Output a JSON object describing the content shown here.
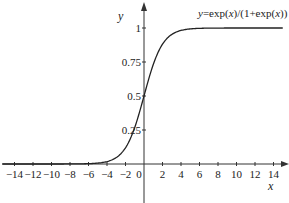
{
  "chart_data": {
    "type": "line",
    "title": "y=exp(x)/(1+exp(x))",
    "title_parts": {
      "pre": "y",
      "mid1": "=exp(",
      "x1": "x",
      "mid2": ")/(1+exp(",
      "x2": "x",
      "post": "))"
    },
    "xlabel": "x",
    "ylabel": "y",
    "xlim": [
      -15.5,
      15.3
    ],
    "ylim": [
      -0.25,
      1.2
    ],
    "grid": false,
    "legend": null,
    "x_ticks": [
      -14,
      -12,
      -10,
      -8,
      -6,
      -4,
      -2,
      0,
      2,
      4,
      6,
      8,
      10,
      12,
      14
    ],
    "x_tick_labels": [
      "−14",
      "−12",
      "−10",
      "−8",
      "−6",
      "−4",
      "−2",
      "0",
      "2",
      "4",
      "6",
      "8",
      "10",
      "12",
      "14"
    ],
    "y_ticks": [
      0.25,
      0.5,
      0.75,
      1
    ],
    "y_tick_labels": [
      "0.25",
      "0.5",
      "0.75",
      "1"
    ],
    "series": [
      {
        "name": "y=exp(x)/(1+exp(x))",
        "function": "logistic",
        "x": [
          -15,
          -10,
          -8,
          -6,
          -5,
          -4,
          -3,
          -2,
          -1,
          0,
          1,
          2,
          3,
          4,
          5,
          6,
          8,
          10,
          15
        ],
        "values": [
          0.0,
          0.0,
          0.0003,
          0.0025,
          0.0067,
          0.018,
          0.047,
          0.119,
          0.269,
          0.5,
          0.731,
          0.881,
          0.953,
          0.982,
          0.993,
          0.9975,
          0.9997,
          1.0,
          1.0
        ]
      }
    ],
    "colors": {
      "line": "#222222",
      "axis": "#333333"
    }
  }
}
